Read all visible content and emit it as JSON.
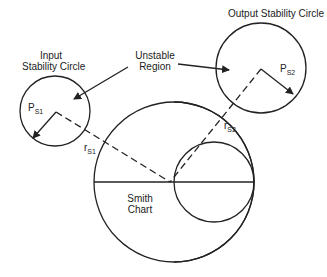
{
  "labels": {
    "input_circle_line1": "Input",
    "input_circle_line2": "Stability Circle",
    "output_circle": "Output Stability Circle",
    "unstable_line1": "Unstable",
    "unstable_line2": "Region",
    "smith_line1": "Smith",
    "smith_line2": "Chart"
  },
  "symbols": {
    "ps1_main": "P",
    "ps1_sub": "S1",
    "ps2_main": "P",
    "ps2_sub": "S2",
    "rs1_main": "r",
    "rs1_sub": "S1",
    "rs2_main": "r",
    "rs2_sub": "S2"
  },
  "colors": {
    "stroke": "#222222",
    "background": "#ffffff"
  }
}
